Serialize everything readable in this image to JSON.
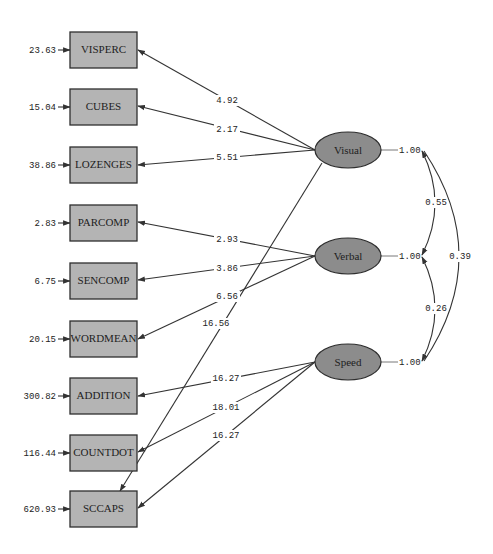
{
  "diagram": {
    "type": "path_diagram",
    "observed": [
      {
        "name": "VISPERC",
        "error": "23.63"
      },
      {
        "name": "CUBES",
        "error": "15.04"
      },
      {
        "name": "LOZENGES",
        "error": "38.86"
      },
      {
        "name": "PARCOMP",
        "error": "2.83"
      },
      {
        "name": "SENCOMP",
        "error": "6.75"
      },
      {
        "name": "WORDMEAN",
        "error": "20.15"
      },
      {
        "name": "ADDITION",
        "error": "300.82"
      },
      {
        "name": "COUNTDOT",
        "error": "116.44"
      },
      {
        "name": "SCCAPS",
        "error": "620.93"
      }
    ],
    "latent": [
      {
        "name": "Visual",
        "variance": "1.00"
      },
      {
        "name": "Verbal",
        "variance": "1.00"
      },
      {
        "name": "Speed",
        "variance": "1.00"
      }
    ],
    "loadings": [
      {
        "from": "Visual",
        "to": "VISPERC",
        "value": "4.92"
      },
      {
        "from": "Visual",
        "to": "CUBES",
        "value": "2.17"
      },
      {
        "from": "Visual",
        "to": "LOZENGES",
        "value": "5.51"
      },
      {
        "from": "Visual",
        "to": "SCCAPS",
        "value": "16.56"
      },
      {
        "from": "Verbal",
        "to": "PARCOMP",
        "value": "2.93"
      },
      {
        "from": "Verbal",
        "to": "SENCOMP",
        "value": "3.86"
      },
      {
        "from": "Verbal",
        "to": "WORDMEAN",
        "value": "6.56"
      },
      {
        "from": "Speed",
        "to": "ADDITION",
        "value": "16.27"
      },
      {
        "from": "Speed",
        "to": "COUNTDOT",
        "value": "18.01"
      },
      {
        "from": "Speed",
        "to": "SCCAPS",
        "value": "16.27"
      }
    ],
    "covariances": [
      {
        "between": [
          "Visual",
          "Verbal"
        ],
        "value": "0.55"
      },
      {
        "between": [
          "Verbal",
          "Speed"
        ],
        "value": "0.26"
      },
      {
        "between": [
          "Visual",
          "Speed"
        ],
        "value": "0.39"
      }
    ],
    "colors": {
      "observed_fill": "#b4b4b4",
      "latent_fill": "#8c8c8c",
      "line": "#333333",
      "background": "#ffffff"
    }
  }
}
